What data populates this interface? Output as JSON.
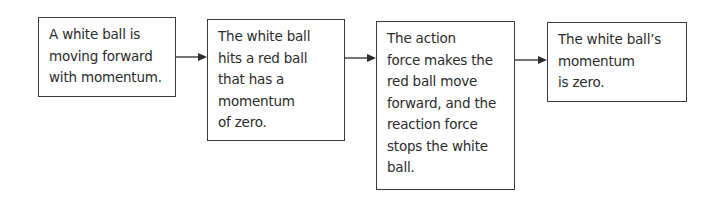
{
  "diagram": {
    "type": "flowchart",
    "direction": "left-to-right",
    "nodes": [
      {
        "id": "box1",
        "text": "A white ball is\nmoving forward\nwith momentum."
      },
      {
        "id": "box2",
        "text": "The white ball\nhits a red ball\nthat has a\nmomentum\nof zero."
      },
      {
        "id": "box3",
        "text": "The action\nforce makes the\nred ball move\nforward, and the\nreaction force\nstops the white\nball."
      },
      {
        "id": "box4",
        "text": "The white ball’s\nmomentum\nis zero."
      }
    ],
    "edges": [
      {
        "from": "box1",
        "to": "box2"
      },
      {
        "from": "box2",
        "to": "box3"
      },
      {
        "from": "box3",
        "to": "box4"
      }
    ],
    "colors": {
      "border": "#3a3a3a",
      "text": "#2b2b2b",
      "background": "#ffffff"
    }
  }
}
